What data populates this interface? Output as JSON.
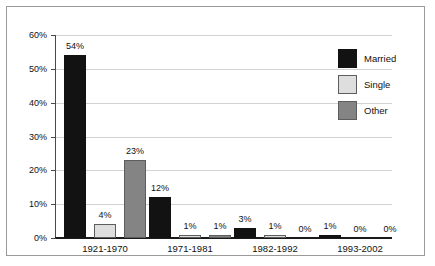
{
  "chart_data": {
    "type": "bar",
    "title": "",
    "subtitle": "",
    "xlabel": "",
    "ylabel": "",
    "ylim": [
      0,
      60
    ],
    "yticks": [
      "0%",
      "10%",
      "20%",
      "30%",
      "40%",
      "50%",
      "60%"
    ],
    "ytick_values": [
      0,
      10,
      20,
      30,
      40,
      50,
      60
    ],
    "grid": true,
    "legend_position": "top-right",
    "categories": [
      "1921-1970",
      "1971-1981",
      "1982-1992",
      "1993-2002"
    ],
    "series": [
      {
        "name": "Married",
        "color": "#121212",
        "values": [
          54,
          12,
          3,
          1
        ],
        "labels": [
          "54%",
          "12%",
          "3%",
          "1%"
        ]
      },
      {
        "name": "Single",
        "color": "#dedede",
        "values": [
          4,
          1,
          1,
          0
        ],
        "labels": [
          "4%",
          "1%",
          "1%",
          "0%"
        ]
      },
      {
        "name": "Other",
        "color": "#848484",
        "values": [
          23,
          1,
          0,
          0
        ],
        "labels": [
          "23%",
          "1%",
          "0%",
          "0%"
        ]
      }
    ]
  },
  "legend": {
    "items": [
      {
        "label": "Married",
        "color": "#121212"
      },
      {
        "label": "Single",
        "color": "#dedede"
      },
      {
        "label": "Other",
        "color": "#848484"
      }
    ]
  }
}
